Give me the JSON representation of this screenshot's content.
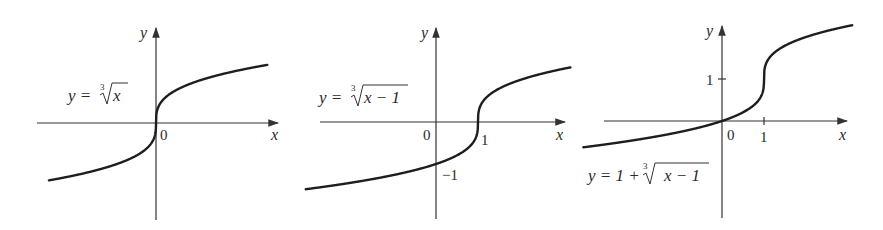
{
  "chart_data": [
    {
      "type": "line",
      "title": "",
      "equation": "y = ∛x",
      "eq_parts": {
        "lhs": "y =",
        "index": "3",
        "radicand": "x"
      },
      "xlabel": "x",
      "ylabel": "y",
      "tick_labels": {
        "origin": "0"
      },
      "function": "cbrt(x)",
      "x_range": [
        -2.55,
        2.65
      ],
      "points": [
        [
          -2.5,
          -1.357
        ],
        [
          -1,
          -1
        ],
        [
          -0.125,
          -0.5
        ],
        [
          0,
          0
        ],
        [
          0.125,
          0.5
        ],
        [
          1,
          1
        ],
        [
          2.5,
          1.357
        ]
      ],
      "grid": false,
      "legend": null
    },
    {
      "type": "line",
      "title": "",
      "equation": "y = ∛(x − 1)",
      "eq_parts": {
        "lhs": "y =",
        "index": "3",
        "radicand": "x − 1"
      },
      "xlabel": "x",
      "ylabel": "y",
      "tick_labels": {
        "origin": "0",
        "x_one": "1",
        "y_minus_one": "−1"
      },
      "function": "cbrt(x-1)",
      "x_range": [
        -3.1,
        3.2
      ],
      "points": [
        [
          -3,
          -1.587
        ],
        [
          0,
          -1
        ],
        [
          0.875,
          -0.5
        ],
        [
          1,
          0
        ],
        [
          1.125,
          0.5
        ],
        [
          2,
          1
        ],
        [
          3,
          1.26
        ]
      ],
      "grid": false,
      "legend": null
    },
    {
      "type": "line",
      "title": "",
      "equation": "y = 1 + ∛(x − 1)",
      "eq_parts": {
        "lhs": "y = 1 +",
        "index": "3",
        "radicand": "x − 1"
      },
      "xlabel": "x",
      "ylabel": "y",
      "tick_labels": {
        "origin": "0",
        "x_one": "1",
        "y_one": "1"
      },
      "function": "1 + cbrt(x-1)",
      "x_range": [
        -3.3,
        3.1
      ],
      "points": [
        [
          -3,
          -0.587
        ],
        [
          0,
          0
        ],
        [
          0.875,
          0.5
        ],
        [
          1,
          1
        ],
        [
          1.125,
          1.5
        ],
        [
          2,
          2
        ],
        [
          3,
          2.26
        ]
      ],
      "grid": false,
      "legend": null
    }
  ]
}
